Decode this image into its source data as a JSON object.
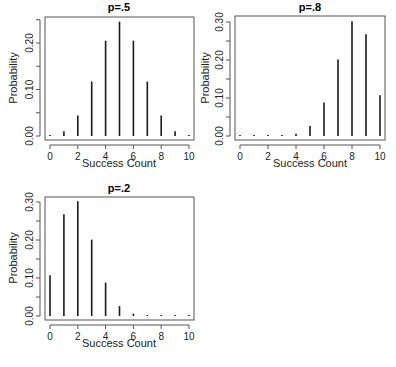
{
  "chart_data": [
    {
      "type": "bar",
      "title": "p=.5",
      "xlabel": "Success Count",
      "ylabel": "Probability",
      "x": [
        0,
        1,
        2,
        3,
        4,
        5,
        6,
        7,
        8,
        9,
        10
      ],
      "values": [
        0.001,
        0.01,
        0.044,
        0.117,
        0.205,
        0.246,
        0.205,
        0.117,
        0.044,
        0.01,
        0.001
      ],
      "xticks": [
        "0",
        "2",
        "4",
        "6",
        "8",
        "10"
      ],
      "yticks": [
        "0.00",
        "0.10",
        "0.20"
      ],
      "ylim": [
        0,
        0.25
      ],
      "grid": false,
      "legend": null
    },
    {
      "type": "bar",
      "title": "p=.8",
      "xlabel": "Success Count",
      "ylabel": "Probability",
      "x": [
        0,
        1,
        2,
        3,
        4,
        5,
        6,
        7,
        8,
        9,
        10
      ],
      "values": [
        0.0,
        0.0,
        0.0,
        0.001,
        0.006,
        0.026,
        0.088,
        0.201,
        0.302,
        0.268,
        0.107
      ],
      "xticks": [
        "0",
        "2",
        "4",
        "6",
        "8",
        "10"
      ],
      "yticks": [
        "0.00",
        "0.10",
        "0.20",
        "0.30"
      ],
      "ylim": [
        0,
        0.3
      ],
      "grid": false,
      "legend": null
    },
    {
      "type": "bar",
      "title": "p=.2",
      "xlabel": "Success Count",
      "ylabel": "Probability",
      "x": [
        0,
        1,
        2,
        3,
        4,
        5,
        6,
        7,
        8,
        9,
        10
      ],
      "values": [
        0.107,
        0.268,
        0.302,
        0.201,
        0.088,
        0.026,
        0.006,
        0.001,
        0.0,
        0.0,
        0.0
      ],
      "xticks": [
        "0",
        "2",
        "4",
        "6",
        "8",
        "10"
      ],
      "yticks": [
        "0.00",
        "0.10",
        "0.20",
        "0.30"
      ],
      "ylim": [
        0,
        0.3
      ],
      "grid": false,
      "legend": null
    }
  ],
  "panels": [
    {
      "title": "p=.5",
      "xlabel": "Success Count",
      "ylabel": "Probability"
    },
    {
      "title": "p=.8",
      "xlabel": "Success Count",
      "ylabel": "Probability"
    },
    {
      "title": "p=.2",
      "xlabel": "Success Count",
      "ylabel": "Probability"
    }
  ]
}
